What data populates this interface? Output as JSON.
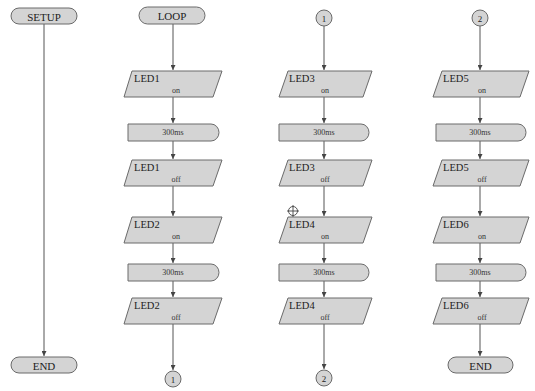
{
  "diagram": {
    "type": "flowchart",
    "colors": {
      "shape_fill": "#d4d4d4",
      "shape_stroke": "#6a6a6a",
      "line": "#555555",
      "background": "#ffffff"
    },
    "columns": [
      {
        "id": "setup",
        "start": {
          "kind": "terminal",
          "label": "SETUP"
        },
        "steps": [],
        "end": {
          "kind": "terminal",
          "label": "END"
        }
      },
      {
        "id": "loop",
        "start": {
          "kind": "terminal",
          "label": "LOOP"
        },
        "steps": [
          {
            "kind": "io",
            "device": "LED1",
            "state": "on"
          },
          {
            "kind": "delay",
            "label": "300ms"
          },
          {
            "kind": "io",
            "device": "LED1",
            "state": "off"
          },
          {
            "kind": "io",
            "device": "LED2",
            "state": "on"
          },
          {
            "kind": "delay",
            "label": "300ms"
          },
          {
            "kind": "io",
            "device": "LED2",
            "state": "off"
          }
        ],
        "end": {
          "kind": "connector",
          "label": "1"
        }
      },
      {
        "id": "part1",
        "start": {
          "kind": "connector",
          "label": "1"
        },
        "steps": [
          {
            "kind": "io",
            "device": "LED3",
            "state": "on"
          },
          {
            "kind": "delay",
            "label": "300ms"
          },
          {
            "kind": "io",
            "device": "LED3",
            "state": "off"
          },
          {
            "kind": "io",
            "device": "LED4",
            "state": "on"
          },
          {
            "kind": "delay",
            "label": "300ms"
          },
          {
            "kind": "io",
            "device": "LED4",
            "state": "off"
          }
        ],
        "end": {
          "kind": "connector",
          "label": "2"
        }
      },
      {
        "id": "part2",
        "start": {
          "kind": "connector",
          "label": "2"
        },
        "steps": [
          {
            "kind": "io",
            "device": "LED5",
            "state": "on"
          },
          {
            "kind": "delay",
            "label": "300ms"
          },
          {
            "kind": "io",
            "device": "LED5",
            "state": "off"
          },
          {
            "kind": "io",
            "device": "LED6",
            "state": "on"
          },
          {
            "kind": "delay",
            "label": "300ms"
          },
          {
            "kind": "io",
            "device": "LED6",
            "state": "off"
          }
        ],
        "end": {
          "kind": "terminal",
          "label": "END"
        }
      }
    ],
    "marker": {
      "icon": "crosshair-icon",
      "x": 293,
      "y": 211
    }
  }
}
